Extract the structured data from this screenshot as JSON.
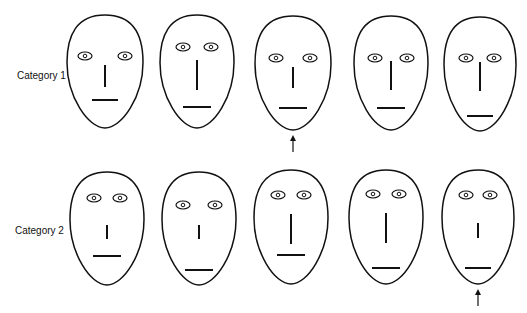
{
  "rows": [
    {
      "label": "Category 1",
      "faces": [
        {
          "id": 1,
          "cx": 105,
          "top": 15,
          "bottom": 128,
          "half_width": 38,
          "eye_y": 56,
          "eye_dx": 20,
          "nose_top": 65,
          "nose_bottom": 87,
          "mouth_y": 100,
          "mouth_half": 13,
          "arrow": false
        },
        {
          "id": 2,
          "cx": 197,
          "top": 15,
          "bottom": 128,
          "half_width": 37,
          "eye_y": 47,
          "eye_dx": 14,
          "nose_top": 60,
          "nose_bottom": 90,
          "mouth_y": 107,
          "mouth_half": 14,
          "arrow": false
        },
        {
          "id": 3,
          "cx": 293,
          "top": 16,
          "bottom": 130,
          "half_width": 38,
          "eye_y": 58,
          "eye_dx": 17,
          "nose_top": 67,
          "nose_bottom": 88,
          "mouth_y": 108,
          "mouth_half": 14,
          "arrow": true
        },
        {
          "id": 4,
          "cx": 391,
          "top": 16,
          "bottom": 130,
          "half_width": 37,
          "eye_y": 58,
          "eye_dx": 16,
          "nose_top": 61,
          "nose_bottom": 90,
          "mouth_y": 108,
          "mouth_half": 14,
          "arrow": false
        },
        {
          "id": 5,
          "cx": 480,
          "top": 17,
          "bottom": 131,
          "half_width": 36,
          "eye_y": 58,
          "eye_dx": 14,
          "nose_top": 62,
          "nose_bottom": 91,
          "mouth_y": 116,
          "mouth_half": 13,
          "arrow": false
        }
      ]
    },
    {
      "label": "Category 2",
      "faces": [
        {
          "id": 6,
          "cx": 107,
          "top": 172,
          "bottom": 285,
          "half_width": 37,
          "eye_y": 198,
          "eye_dx": 13,
          "nose_top": 225,
          "nose_bottom": 239,
          "mouth_y": 256,
          "mouth_half": 14,
          "arrow": false
        },
        {
          "id": 7,
          "cx": 199,
          "top": 172,
          "bottom": 285,
          "half_width": 37,
          "eye_y": 205,
          "eye_dx": 16,
          "nose_top": 225,
          "nose_bottom": 239,
          "mouth_y": 270,
          "mouth_half": 14,
          "arrow": false
        },
        {
          "id": 8,
          "cx": 291,
          "top": 170,
          "bottom": 284,
          "half_width": 37,
          "eye_y": 195,
          "eye_dx": 13,
          "nose_top": 214,
          "nose_bottom": 244,
          "mouth_y": 255,
          "mouth_half": 14,
          "arrow": false
        },
        {
          "id": 9,
          "cx": 386,
          "top": 170,
          "bottom": 284,
          "half_width": 37,
          "eye_y": 194,
          "eye_dx": 13,
          "nose_top": 213,
          "nose_bottom": 243,
          "mouth_y": 268,
          "mouth_half": 14,
          "arrow": false
        },
        {
          "id": 10,
          "cx": 478,
          "top": 170,
          "bottom": 284,
          "half_width": 36,
          "eye_y": 195,
          "eye_dx": 12,
          "nose_top": 223,
          "nose_bottom": 238,
          "mouth_y": 268,
          "mouth_half": 13,
          "arrow": true
        }
      ]
    }
  ],
  "labels": {
    "row1": "Category 1",
    "row2": "Category 2"
  },
  "colors": {
    "stroke": "#111111",
    "background": "#ffffff"
  }
}
